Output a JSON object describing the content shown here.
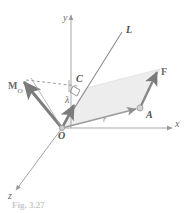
{
  "figure": {
    "kind": "vector-mechanics-diagram",
    "background_color": "#ffffff",
    "stroke_color": "#8c8c8c",
    "vector_color": "#7a7a7a",
    "fill_color": "#ebebeb",
    "label_color": "#5a5a5a",
    "caption": "Fig. 3.27"
  },
  "axes": [
    {
      "name": "y-axis",
      "label": "y"
    },
    {
      "name": "x-axis",
      "label": "x"
    },
    {
      "name": "z-axis",
      "label": "z"
    }
  ],
  "labels": {
    "y_axis": "y",
    "x_axis": "x",
    "z_axis": "z",
    "line_L": "L",
    "origin": "O",
    "point_A": "A",
    "point_C": "C",
    "force": "F",
    "moment_main": "M",
    "moment_sub": "O",
    "unit_vector": "λ",
    "position_vector": "r"
  },
  "geometry": {
    "origin": {
      "x": 62,
      "y": 128
    },
    "point_A": {
      "x": 140,
      "y": 108
    },
    "point_C": {
      "x": 77,
      "y": 84
    },
    "force_tip": {
      "x": 160,
      "y": 69
    },
    "moment_tip": {
      "x": 20,
      "y": 80
    },
    "line_L_tip": {
      "x": 124,
      "y": 30
    },
    "y_axis_top": {
      "x": 71,
      "y": 12
    },
    "x_axis_end": {
      "x": 175,
      "y": 128
    },
    "z_axis_end": {
      "x": 13,
      "y": 193
    }
  },
  "annotations": {
    "right_angle_at_C": true,
    "dashed_line": "from moment arrow tip to point C region",
    "parallelogram_shading": "triangle-OAF plane shaded light gray"
  }
}
